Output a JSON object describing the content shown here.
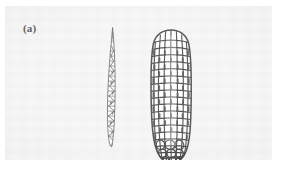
{
  "figure": {
    "panel_label": "(a)",
    "background_color": "#f3f3f3",
    "page_color": "#ffffff",
    "ink_color": "#1a1a1a",
    "caption_text": "",
    "specimens": [
      {
        "name": "teosinte-ear",
        "position": "left",
        "description": "slender tapering two-ranked ear with zigzag rachis segments",
        "kernel_rows": 2,
        "outline_color": "#2a2a2a",
        "fill_color": "#fbfbfb"
      },
      {
        "name": "maize-ear",
        "position": "right",
        "description": "thick cylindrical ear with many straight rows of rectangular kernels",
        "kernel_rows": 8,
        "outline_color": "#141414",
        "fill_color": "#fdfdfd"
      }
    ]
  }
}
